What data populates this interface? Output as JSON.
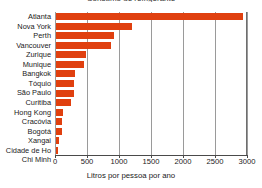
{
  "chart_data": {
    "type": "bar",
    "orientation": "horizontal",
    "title": "Consumo de refrigerante",
    "xlabel": "Litros por pessoa por ano",
    "ylabel": "",
    "xlim": [
      0,
      3000
    ],
    "xticks": [
      0,
      500,
      1000,
      1500,
      2000,
      2500,
      3000
    ],
    "grid": true,
    "legend": false,
    "bar_color": "#e0400f",
    "categories": [
      "Atlanta",
      "Nova York",
      "Perth",
      "Vancouver",
      "Zurique",
      "Munique",
      "Bangkok",
      "Tóquio",
      "São Paulo",
      "Curitiba",
      "Hong Kong",
      "Cracóvia",
      "Bogotá",
      "Xangai",
      "Cidade de Ho Chi Minh"
    ],
    "category_lines": [
      [
        "Atlanta"
      ],
      [
        "Nova York"
      ],
      [
        "Perth"
      ],
      [
        "Vancouver"
      ],
      [
        "Zurique"
      ],
      [
        "Munique"
      ],
      [
        "Bangkok"
      ],
      [
        "Tóquio"
      ],
      [
        "São Paulo"
      ],
      [
        "Curitiba"
      ],
      [
        "Hong Kong"
      ],
      [
        "Cracóvia"
      ],
      [
        "Bogotá"
      ],
      [
        "Xangai"
      ],
      [
        "Cidade de Ho",
        "Chi Minh"
      ]
    ],
    "values": [
      2930,
      1200,
      920,
      870,
      490,
      450,
      320,
      300,
      295,
      250,
      130,
      110,
      105,
      65,
      50
    ]
  }
}
